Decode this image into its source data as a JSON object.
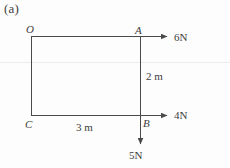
{
  "figure": {
    "caption": "(a)",
    "type": "force-diagram",
    "stroke_color": "#4a4a4a",
    "text_color": "#3c3c3c",
    "background_color": "#fdfdfd"
  },
  "vertices": [
    {
      "label": "O",
      "position": "top-left"
    },
    {
      "label": "A",
      "position": "top-right"
    },
    {
      "label": "B",
      "position": "bottom-right"
    },
    {
      "label": "C",
      "position": "bottom-left"
    }
  ],
  "forces": [
    {
      "label": "6N",
      "magnitude": 6,
      "unit": "N",
      "direction": "right",
      "applied_at": "A"
    },
    {
      "label": "4N",
      "magnitude": 4,
      "unit": "N",
      "direction": "right",
      "applied_at": "B"
    },
    {
      "label": "5N",
      "magnitude": 5,
      "unit": "N",
      "direction": "down",
      "applied_at": "B"
    }
  ],
  "dimensions": [
    {
      "label": "2 m",
      "value": 2,
      "unit": "m",
      "edge": "AB",
      "orientation": "vertical"
    },
    {
      "label": "3 m",
      "value": 3,
      "unit": "m",
      "edge": "CB",
      "orientation": "horizontal"
    }
  ]
}
